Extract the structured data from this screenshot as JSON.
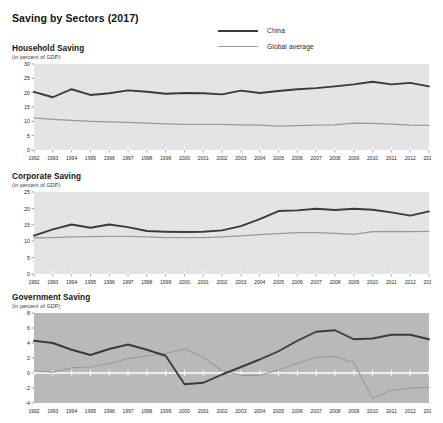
{
  "figure": {
    "title": "Saving by Sectors (2017)",
    "subtitle_text": "(in percent of GDP)"
  },
  "legend": {
    "position": "top-center-right",
    "entries": [
      {
        "key": "china",
        "label": "China",
        "color": "#3b3b3b"
      },
      {
        "key": "global",
        "label": "Global average",
        "color": "#9a9a9a"
      }
    ]
  },
  "colors": {
    "china": "#3b3b3b",
    "global": "#9a9a9a",
    "plot_bg_light": "#e4e4e4",
    "plot_bg_dark": "#b9b9b9",
    "zero_line": "#ffffff",
    "tick": "#5a5a5a",
    "text": "#141414"
  },
  "panels": [
    {
      "id": "household",
      "title": "Household Saving",
      "subtitle": "(in percent of GDP)"
    },
    {
      "id": "corporate",
      "title": "Corporate Saving",
      "subtitle": "(in percent of GDP)"
    },
    {
      "id": "government",
      "title": "Government Saving",
      "subtitle": "(in percent of GDP)"
    }
  ],
  "chart_data": [
    {
      "type": "line",
      "id": "household",
      "title": "Household Saving",
      "subtitle": "(in percent of GDP)",
      "xlabel": "",
      "ylabel": "in percent of GDP",
      "grid": false,
      "legend": [
        "China",
        "Global average"
      ],
      "x": [
        1992,
        1993,
        1994,
        1995,
        1996,
        1997,
        1998,
        1999,
        2000,
        2001,
        2002,
        2003,
        2004,
        2005,
        2006,
        2007,
        2008,
        2009,
        2010,
        2011,
        2012,
        2013
      ],
      "xlim": [
        1992,
        2013
      ],
      "ylim": [
        0,
        30
      ],
      "yticks": [
        0,
        5,
        10,
        15,
        20,
        25,
        30
      ],
      "series": [
        {
          "name": "China",
          "color": "#3b3b3b",
          "values": [
            20.3,
            18.4,
            21.2,
            19.2,
            19.8,
            20.8,
            20.3,
            19.6,
            19.9,
            19.8,
            19.4,
            20.7,
            19.9,
            20.6,
            21.2,
            21.6,
            22.2,
            22.9,
            23.8,
            22.9,
            23.4,
            22.2
          ]
        },
        {
          "name": "Global average",
          "color": "#9a9a9a",
          "values": [
            11.2,
            10.7,
            10.3,
            10.0,
            9.8,
            9.6,
            9.4,
            9.1,
            8.9,
            8.9,
            8.9,
            8.8,
            8.7,
            8.3,
            8.5,
            8.7,
            8.8,
            9.4,
            9.3,
            9.0,
            8.7,
            8.6
          ]
        }
      ]
    },
    {
      "type": "line",
      "id": "corporate",
      "title": "Corporate Saving",
      "subtitle": "(in percent of GDP)",
      "xlabel": "",
      "ylabel": "in percent of GDP",
      "grid": false,
      "legend": [
        "China",
        "Global average"
      ],
      "x": [
        1992,
        1993,
        1994,
        1995,
        1996,
        1997,
        1998,
        1999,
        2000,
        2001,
        2002,
        2003,
        2004,
        2005,
        2006,
        2007,
        2008,
        2009,
        2010,
        2011,
        2012,
        2013
      ],
      "xlim": [
        1992,
        2013
      ],
      "ylim": [
        0,
        25
      ],
      "yticks": [
        0,
        5,
        10,
        15,
        20,
        25
      ],
      "series": [
        {
          "name": "China",
          "color": "#3b3b3b",
          "values": [
            11.7,
            13.6,
            15.1,
            14.1,
            15.1,
            14.3,
            13.1,
            12.9,
            12.8,
            12.9,
            13.3,
            14.6,
            16.7,
            19.2,
            19.4,
            19.9,
            19.5,
            19.9,
            19.6,
            18.8,
            17.8,
            19.1
          ]
        },
        {
          "name": "Global average",
          "color": "#9a9a9a",
          "values": [
            11.0,
            11.1,
            11.3,
            11.4,
            11.5,
            11.5,
            11.3,
            11.1,
            11.1,
            11.1,
            11.3,
            11.6,
            12.0,
            12.3,
            12.6,
            12.6,
            12.4,
            12.1,
            12.9,
            13.0,
            12.9,
            13.0
          ]
        }
      ]
    },
    {
      "type": "line",
      "id": "government",
      "title": "Government Saving",
      "subtitle": "(in percent of GDP)",
      "xlabel": "",
      "ylabel": "in percent of GDP",
      "grid": false,
      "zero_line": true,
      "legend": [
        "China",
        "Global average"
      ],
      "x": [
        1992,
        1993,
        1994,
        1995,
        1996,
        1997,
        1998,
        1999,
        2000,
        2001,
        2002,
        2003,
        2004,
        2005,
        2006,
        2007,
        2008,
        2009,
        2010,
        2011,
        2012,
        2013
      ],
      "xlim": [
        1992,
        2013
      ],
      "ylim": [
        -4,
        8
      ],
      "yticks": [
        -4,
        -2,
        0,
        2,
        4,
        6,
        8
      ],
      "series": [
        {
          "name": "China",
          "color": "#3b3b3b",
          "values": [
            4.3,
            4.0,
            3.1,
            2.4,
            3.2,
            3.8,
            3.1,
            2.3,
            -1.5,
            -1.3,
            -0.2,
            0.8,
            1.8,
            2.9,
            4.3,
            5.5,
            5.7,
            4.5,
            4.6,
            5.1,
            5.1,
            4.5
          ]
        },
        {
          "name": "Global average",
          "color": "#9a9a9a",
          "values": [
            0.3,
            0.1,
            0.7,
            0.8,
            1.3,
            1.9,
            2.3,
            2.6,
            3.2,
            2.1,
            0.3,
            -0.3,
            -0.3,
            0.4,
            1.3,
            2.1,
            2.2,
            1.4,
            -3.4,
            -2.3,
            -2.0,
            -1.9,
            -1.0
          ]
        }
      ]
    }
  ],
  "axis": {
    "year_labels": [
      "1992",
      "1993",
      "1994",
      "1995",
      "1996",
      "1997",
      "1998",
      "1999",
      "2000",
      "2001",
      "2002",
      "2003",
      "2004",
      "2005",
      "2006",
      "2007",
      "2008",
      "2009",
      "2010",
      "2011",
      "2012",
      "2013"
    ]
  }
}
